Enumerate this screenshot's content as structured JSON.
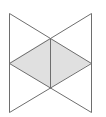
{
  "diagram": {
    "type": "geometric-figure",
    "colors": {
      "background": "#ffffff",
      "stroke": "#6e6e6e",
      "fill": "#e0e0e0"
    },
    "stroke_width": 1,
    "vertices": {
      "top_left": [
        9,
        13
      ],
      "top_right": [
        91,
        13
      ],
      "top_center": [
        50,
        38
      ],
      "mid_left": [
        9,
        63
      ],
      "mid_right": [
        91,
        63
      ],
      "bottom_center": [
        50,
        88
      ],
      "bottom_left": [
        9,
        112
      ],
      "bottom_right": [
        91,
        112
      ]
    },
    "shaded_region": {
      "shape": "rhombus",
      "points": [
        [
          9,
          63
        ],
        [
          50,
          38
        ],
        [
          91,
          63
        ],
        [
          50,
          88
        ]
      ]
    },
    "lines": [
      {
        "name": "left-vertical",
        "from": [
          9,
          13
        ],
        "to": [
          9,
          112
        ]
      },
      {
        "name": "right-vertical",
        "from": [
          91,
          13
        ],
        "to": [
          91,
          112
        ]
      },
      {
        "name": "center-vertical",
        "from": [
          50,
          38
        ],
        "to": [
          50,
          88
        ]
      },
      {
        "name": "diag-topleft-to-midright",
        "from": [
          9,
          13
        ],
        "to": [
          91,
          63
        ]
      },
      {
        "name": "diag-topright-to-midleft",
        "from": [
          91,
          13
        ],
        "to": [
          9,
          63
        ]
      },
      {
        "name": "diag-midleft-to-bottomright",
        "from": [
          9,
          63
        ],
        "to": [
          91,
          112
        ]
      },
      {
        "name": "diag-midright-to-bottomleft",
        "from": [
          91,
          63
        ],
        "to": [
          9,
          112
        ]
      }
    ]
  }
}
